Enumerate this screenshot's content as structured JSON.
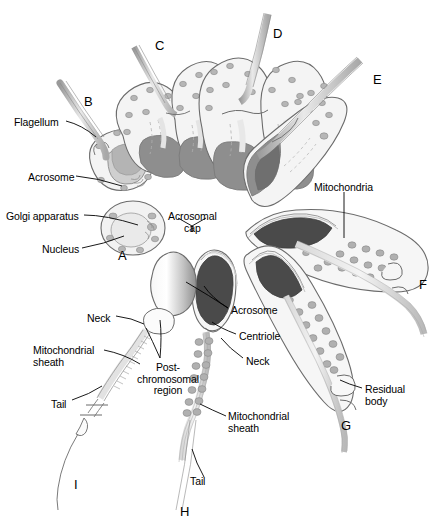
{
  "figure": {
    "background": "#ffffff",
    "width": 442,
    "height": 532
  },
  "colors": {
    "outline": "#6b6b6b",
    "dark_nucleus": "#4a4a4a",
    "mid_gray": "#8a8a8a",
    "light_gray": "#c9c9c9",
    "pale_gray": "#e6e6e6",
    "organelle_gray": "#b0b0b0",
    "text": "#000000",
    "leader_line": "#000000"
  },
  "stage_letters": [
    {
      "id": "A",
      "label": "A",
      "x": 118,
      "y": 248
    },
    {
      "id": "B",
      "label": "B",
      "x": 84,
      "y": 94
    },
    {
      "id": "C",
      "label": "C",
      "x": 155,
      "y": 38
    },
    {
      "id": "D",
      "label": "D",
      "x": 273,
      "y": 26
    },
    {
      "id": "E",
      "label": "E",
      "x": 373,
      "y": 72
    },
    {
      "id": "F",
      "label": "F",
      "x": 419,
      "y": 277
    },
    {
      "id": "G",
      "label": "G",
      "x": 341,
      "y": 418
    },
    {
      "id": "H",
      "label": "H",
      "x": 180,
      "y": 504
    },
    {
      "id": "I",
      "label": "I",
      "x": 74,
      "y": 477
    }
  ],
  "labels": [
    {
      "id": "flagellum",
      "text": "Flagellum",
      "x": 14,
      "y": 117,
      "align": "left"
    },
    {
      "id": "acrosome-b",
      "text": "Acrosome",
      "x": 28,
      "y": 172,
      "align": "left"
    },
    {
      "id": "golgi-apparatus",
      "text": "Golgi apparatus",
      "x": 6,
      "y": 211,
      "align": "left"
    },
    {
      "id": "nucleus",
      "text": "Nucleus",
      "x": 42,
      "y": 244,
      "align": "left"
    },
    {
      "id": "acrosomal-cap",
      "text": "Acrosomal\ncap",
      "x": 168,
      "y": 211,
      "align": "center"
    },
    {
      "id": "mitochondria",
      "text": "Mitochondria",
      "x": 314,
      "y": 182,
      "align": "left"
    },
    {
      "id": "acrosome-h",
      "text": "Acrosome",
      "x": 231,
      "y": 305,
      "align": "left"
    },
    {
      "id": "centriole",
      "text": "Centriole",
      "x": 239,
      "y": 331,
      "align": "left"
    },
    {
      "id": "neck-h",
      "text": "Neck",
      "x": 246,
      "y": 356,
      "align": "left"
    },
    {
      "id": "neck-i",
      "text": "Neck",
      "x": 87,
      "y": 313,
      "align": "left"
    },
    {
      "id": "mitochondrial-sheath-i",
      "text": "Mitochondrial\nsheath",
      "x": 33,
      "y": 345,
      "align": "left"
    },
    {
      "id": "post-chromosomal-region",
      "text": "Post-\nchromosomal\nregion",
      "x": 137,
      "y": 362,
      "align": "center"
    },
    {
      "id": "tail-i",
      "text": "Tail",
      "x": 51,
      "y": 399,
      "align": "left"
    },
    {
      "id": "mitochondrial-sheath-h",
      "text": "Mitochondrial\nsheath",
      "x": 228,
      "y": 411,
      "align": "left"
    },
    {
      "id": "residual-body",
      "text": "Residual\nbody",
      "x": 365,
      "y": 384,
      "align": "left"
    },
    {
      "id": "tail-h",
      "text": "Tail",
      "x": 190,
      "y": 476,
      "align": "left"
    }
  ],
  "caption": {
    "text": ""
  }
}
